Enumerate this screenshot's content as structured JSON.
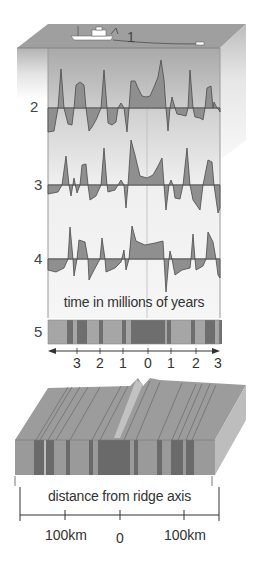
{
  "diagram": {
    "labels": {
      "ship_survey": "1",
      "profile_2": "2",
      "profile_3": "3",
      "profile_4": "4",
      "stripe_band": "5"
    },
    "time_axis": {
      "caption": "time in millions of years",
      "ticks": [
        "3",
        "2",
        "1",
        "0",
        "1",
        "2",
        "3"
      ]
    },
    "distance_axis": {
      "caption": "distance from ridge axis",
      "ticks": [
        "100km",
        "0",
        "100km"
      ]
    },
    "colors": {
      "panel_bg": "#ececec",
      "panel_top": "#a8a8a8",
      "anomaly_fill": "#8f8f8f",
      "anomaly_line": "#4a4a4a",
      "band_light": "#a6a6a6",
      "band_dark": "#6e6e6e",
      "block_top": "#9c9c9c",
      "block_side": "#8a8a8a"
    }
  }
}
